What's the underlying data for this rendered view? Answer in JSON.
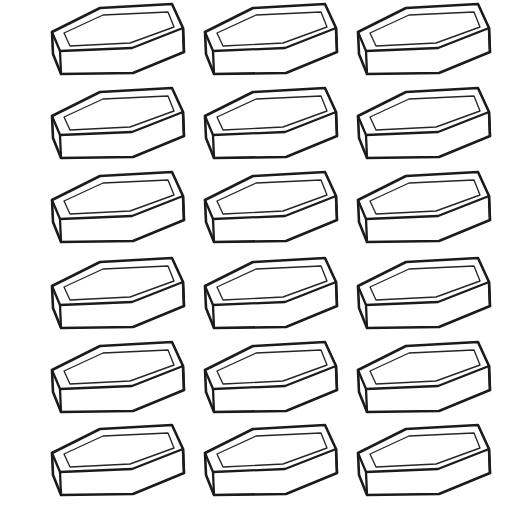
{
  "page": {
    "caption": "",
    "background_color": "#ffffff",
    "width": 515,
    "height": 527
  },
  "illustration": {
    "name": "brick-grid",
    "subject": "brick",
    "style": "line-art",
    "description": "Eighteen identical line-drawn rectangular bricks arranged in a regular grid",
    "line_color": "#1b1b1b",
    "fill_color": "#ffffff",
    "detail_line_color": "#262626",
    "stroke_width_outline": 2.6,
    "stroke_width_detail": 1.35
  },
  "grid": {
    "columns": 3,
    "rows": 6,
    "count": 18,
    "column_x": [
      44,
      197,
      350
    ],
    "row_y": [
      2,
      86,
      170,
      256,
      340,
      423
    ],
    "column_spacing": 153,
    "row_spacing": 84
  },
  "brick_shape": {
    "name": "rectangular-brick",
    "projection": "axonometric",
    "faces": [
      "top",
      "left-end",
      "front"
    ],
    "has_frog_recess": true,
    "width_px": 148,
    "height_px": 88,
    "top_face_path": "M 8,30 L 56,6 L 128,2 L 139,26 L 88,46 L 16,49 Z",
    "left_face_path": "M 8,30 L 16,49 L 17,72 L 9,52 Z",
    "front_face_path": "M 16,49 L 88,46 L 139,26 L 140,50 L 89,71 L 17,72 Z",
    "frog_path": "M 20,31 L 59,13 L 124,10 L 130,25 L 86,41 L 26,44 Z"
  },
  "items": [
    {
      "id": "brick-1",
      "row": 1,
      "col": 1,
      "label": "brick"
    },
    {
      "id": "brick-2",
      "row": 1,
      "col": 2,
      "label": "brick"
    },
    {
      "id": "brick-3",
      "row": 1,
      "col": 3,
      "label": "brick"
    },
    {
      "id": "brick-4",
      "row": 2,
      "col": 1,
      "label": "brick"
    },
    {
      "id": "brick-5",
      "row": 2,
      "col": 2,
      "label": "brick"
    },
    {
      "id": "brick-6",
      "row": 2,
      "col": 3,
      "label": "brick"
    },
    {
      "id": "brick-7",
      "row": 3,
      "col": 1,
      "label": "brick"
    },
    {
      "id": "brick-8",
      "row": 3,
      "col": 2,
      "label": "brick"
    },
    {
      "id": "brick-9",
      "row": 3,
      "col": 3,
      "label": "brick"
    },
    {
      "id": "brick-10",
      "row": 4,
      "col": 1,
      "label": "brick"
    },
    {
      "id": "brick-11",
      "row": 4,
      "col": 2,
      "label": "brick"
    },
    {
      "id": "brick-12",
      "row": 4,
      "col": 3,
      "label": "brick"
    },
    {
      "id": "brick-13",
      "row": 5,
      "col": 1,
      "label": "brick"
    },
    {
      "id": "brick-14",
      "row": 5,
      "col": 2,
      "label": "brick"
    },
    {
      "id": "brick-15",
      "row": 5,
      "col": 3,
      "label": "brick"
    },
    {
      "id": "brick-16",
      "row": 6,
      "col": 1,
      "label": "brick"
    },
    {
      "id": "brick-17",
      "row": 6,
      "col": 2,
      "label": "brick"
    },
    {
      "id": "brick-18",
      "row": 6,
      "col": 3,
      "label": "brick"
    }
  ]
}
